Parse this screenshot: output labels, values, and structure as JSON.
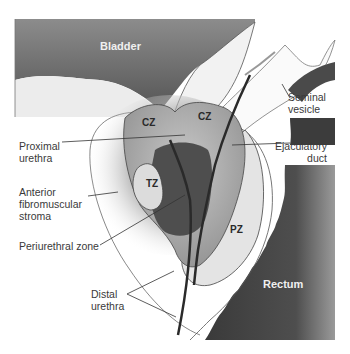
{
  "figure": {
    "type": "anatomical-diagram"
  },
  "organs": {
    "bladder": "Bladder",
    "rectum": "Rectum"
  },
  "zones": {
    "cz_left": "CZ",
    "cz_right": "CZ",
    "tz": "TZ",
    "pz": "PZ"
  },
  "callouts": {
    "seminal_vesicle": "Seminal\nvesicle",
    "proximal_urethra": "Proximal\nurethra",
    "ejaculatory_duct": "Ejaculatory\nduct",
    "anterior_fibromuscular_stroma": "Anterior\nfibromuscular\nstroma",
    "periurethral_zone": "Periurethral zone",
    "distal_urethra": "Distal\nurethra"
  },
  "colors": {
    "background": "#ffffff",
    "dark_organ": "#4a4a4a",
    "mid_gray": "#9a9a9a",
    "light_gray": "#d6d6d6",
    "outline": "#333333"
  }
}
